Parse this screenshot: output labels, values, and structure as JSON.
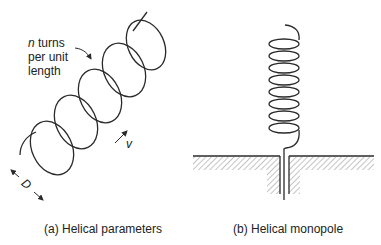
{
  "figure": {
    "panel_a": {
      "caption": "(a) Helical parameters",
      "annotation_n": "n",
      "annotation_line1": " turns",
      "annotation_line2": "per unit",
      "annotation_line3": "length",
      "velocity_label": "v",
      "diameter_label": "D",
      "turns_drawn": 5
    },
    "panel_b": {
      "caption": "(b) Helical monopole",
      "turns_drawn": 8
    },
    "colors": {
      "stroke": "#2a2a2a",
      "hatch": "#8a8a8a",
      "background": "#ffffff"
    }
  }
}
